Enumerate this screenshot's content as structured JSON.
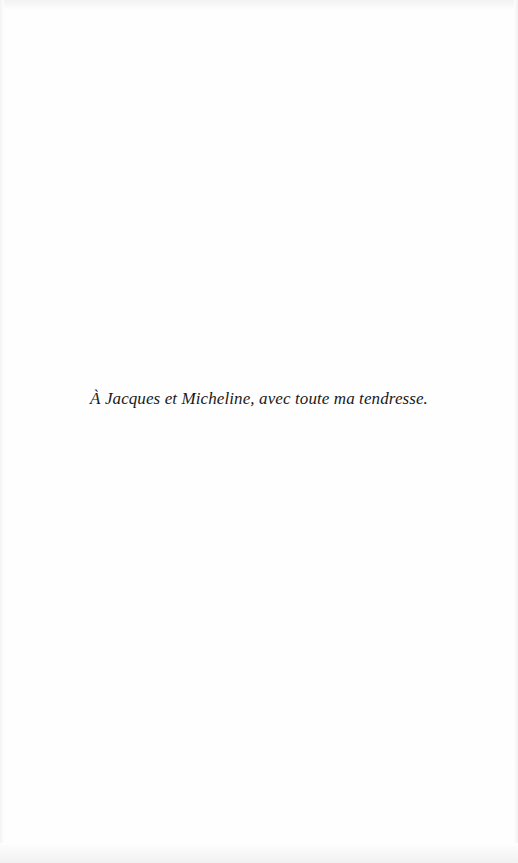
{
  "page": {
    "type": "dedication",
    "background": "#fefefe",
    "text_color": "#1a1a1a"
  },
  "dedication": {
    "text": "À Jacques et Micheline, avec toute ma tendresse."
  }
}
